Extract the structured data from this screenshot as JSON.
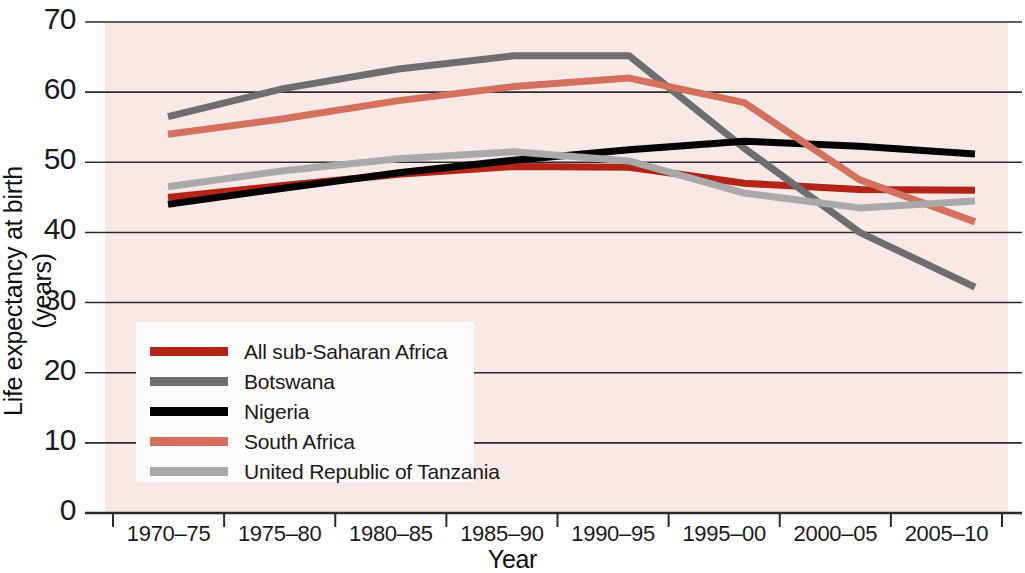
{
  "chart_data": {
    "type": "line",
    "title": "",
    "xlabel": "Year",
    "ylabel": "Life expectancy at birth (years)",
    "categories": [
      "1970–75",
      "1975–80",
      "1980–85",
      "1985–90",
      "1990–95",
      "1995–00",
      "2000–05",
      "2005–10"
    ],
    "ylim": [
      0,
      70
    ],
    "yticks": [
      0,
      10,
      20,
      30,
      40,
      50,
      60,
      70
    ],
    "ytick_labels": [
      "0",
      "10",
      "20",
      "30",
      "40",
      "50",
      "60",
      "70"
    ],
    "grid": "horizontal",
    "legend_position": "inside-lower-left",
    "plot_background": "#f8e9e6",
    "series": [
      {
        "name": "All sub-Saharan Africa",
        "color": "#b32318",
        "values": [
          45.0,
          46.7,
          48.3,
          49.4,
          49.3,
          47.0,
          46.1,
          46.0
        ]
      },
      {
        "name": "Botswana",
        "color": "#6e6e6e",
        "values": [
          56.5,
          60.5,
          63.3,
          65.2,
          65.2,
          52.0,
          40.0,
          32.2
        ]
      },
      {
        "name": "Nigeria",
        "color": "#000000",
        "values": [
          44.0,
          46.3,
          48.5,
          50.3,
          51.8,
          53.0,
          52.3,
          51.2
        ]
      },
      {
        "name": "South Africa",
        "color": "#d4705e",
        "values": [
          54.0,
          56.2,
          58.8,
          60.8,
          62.0,
          58.5,
          47.5,
          41.5
        ]
      },
      {
        "name": "United Republic of Tanzania",
        "color": "#a9a9a9",
        "values": [
          46.5,
          48.8,
          50.5,
          51.5,
          50.2,
          45.6,
          43.5,
          44.5
        ]
      }
    ]
  },
  "axes": {
    "y_title": "Life expectancy at birth (years)",
    "x_title": "Year"
  },
  "legend": {
    "items": [
      {
        "label": "All sub-Saharan Africa",
        "color": "#b32318"
      },
      {
        "label": "Botswana",
        "color": "#6e6e6e"
      },
      {
        "label": "Nigeria",
        "color": "#000000"
      },
      {
        "label": "South Africa",
        "color": "#d4705e"
      },
      {
        "label": "United Republic of Tanzania",
        "color": "#a9a9a9"
      }
    ]
  }
}
